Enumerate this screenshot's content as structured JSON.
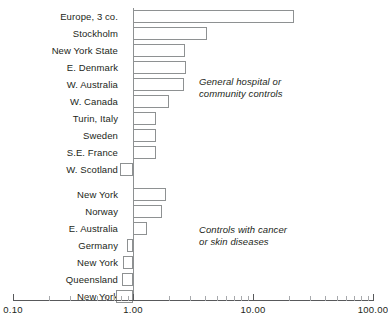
{
  "chart_data": {
    "type": "bar",
    "orientation": "horizontal",
    "title": "",
    "xlabel": "",
    "ylabel": "",
    "xscale": "log",
    "xlim": [
      0.1,
      100.0
    ],
    "grid": false,
    "legend": null,
    "tick_labels": [
      "0.10",
      "1.00",
      "10.00",
      "100.00"
    ],
    "tick_values": [
      0.1,
      1.0,
      10.0,
      100.0
    ],
    "reference_line": 1.0,
    "categories": [
      "Europe, 3 co.",
      "Stockholm",
      "New York State",
      "E. Denmark",
      "W. Australia",
      "W. Canada",
      "Turin, Italy",
      "Sweden",
      "S.E. France",
      "W. Scotland",
      "",
      "New York",
      "Norway",
      "E. Australia",
      "Germany",
      "New York",
      "Queensland",
      "New York"
    ],
    "values": [
      22.0,
      4.1,
      2.7,
      2.75,
      2.65,
      2.0,
      1.55,
      1.55,
      1.55,
      0.78,
      null,
      1.9,
      1.75,
      1.3,
      0.89,
      0.82,
      0.81,
      0.72
    ],
    "groups": [
      {
        "label": "General hospital or\ncommunity controls",
        "categories": [
          "Europe, 3 co.",
          "Stockholm",
          "New York State",
          "E. Denmark",
          "W. Australia",
          "W. Canada",
          "Turin, Italy",
          "Sweden",
          "S.E. France",
          "W. Scotland"
        ]
      },
      {
        "label": "Controls with cancer\nor skin diseases",
        "categories": [
          "New York",
          "Norway",
          "E. Australia",
          "Germany",
          "New York",
          "Queensland",
          "New York"
        ]
      }
    ],
    "annotations": [
      {
        "text": "General hospital or\ncommunity controls",
        "x": 3.1,
        "row": 4
      },
      {
        "text": "Controls with cancer\nor skin diseases",
        "x": 3.1,
        "row": 13
      }
    ]
  },
  "rows": [
    {
      "label": "Europe, 3 co.",
      "value": 22.0,
      "y": 10
    },
    {
      "label": "Stockholm",
      "value": 4.1,
      "y": 27
    },
    {
      "label": "New York State",
      "value": 2.7,
      "y": 44
    },
    {
      "label": "E. Denmark",
      "value": 2.75,
      "y": 61
    },
    {
      "label": "W. Australia",
      "value": 2.65,
      "y": 78
    },
    {
      "label": "W. Canada",
      "value": 2.0,
      "y": 95
    },
    {
      "label": "Turin, Italy",
      "value": 1.55,
      "y": 112
    },
    {
      "label": "Sweden",
      "value": 1.55,
      "y": 129
    },
    {
      "label": "S.E. France",
      "value": 1.55,
      "y": 146
    },
    {
      "label": "W. Scotland",
      "value": 0.78,
      "y": 163
    },
    {
      "label": "New York",
      "value": 1.9,
      "y": 188
    },
    {
      "label": "Norway",
      "value": 1.75,
      "y": 205
    },
    {
      "label": "E. Australia",
      "value": 1.3,
      "y": 222
    },
    {
      "label": "Germany",
      "value": 0.89,
      "y": 239
    },
    {
      "label": "New York",
      "value": 0.82,
      "y": 256
    },
    {
      "label": "Queensland",
      "value": 0.81,
      "y": 273
    },
    {
      "label": "New York",
      "value": 0.72,
      "y": 290
    }
  ],
  "axis": {
    "ticks": [
      {
        "label": "0.10",
        "value": 0.1
      },
      {
        "label": "1.00",
        "value": 1.0
      },
      {
        "label": "10.00",
        "value": 10.0
      },
      {
        "label": "100.00",
        "value": 100.0
      }
    ],
    "minor_ticks": [
      0.2,
      0.3,
      0.4,
      0.5,
      0.6,
      0.7,
      0.8,
      0.9,
      2,
      3,
      4,
      5,
      6,
      7,
      8,
      9,
      20,
      30,
      40,
      50,
      60,
      70,
      80,
      90
    ]
  },
  "annotations": [
    {
      "line1": "General hospital or",
      "line2": "community controls",
      "left": 199,
      "top": 76
    },
    {
      "line1": "Controls with cancer",
      "line2": "or skin diseases",
      "left": 199,
      "top": 224
    }
  ],
  "colors": {
    "bar_stroke": "#8e9192",
    "bar_fill": "#ffffff",
    "axis": "#58595b",
    "text": "#231f20",
    "background": "#ffffff"
  }
}
